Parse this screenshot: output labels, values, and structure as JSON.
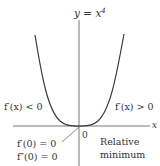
{
  "title": {
    "base": "y = x",
    "exponent": "4"
  },
  "axes": {
    "x_label": "x",
    "origin_label": "0"
  },
  "labels": {
    "left_slope": "f′(x) < 0",
    "right_slope": "f′(x) > 0",
    "first_derivative_zero": "f′(0) = 0",
    "second_derivative_zero": "f″(0) = 0",
    "relative_line1": "Relative",
    "relative_line2": "minimum"
  },
  "colors": {
    "curve": "#3a3a3a",
    "axis": "#6a6a6a",
    "text": "#333333"
  }
}
